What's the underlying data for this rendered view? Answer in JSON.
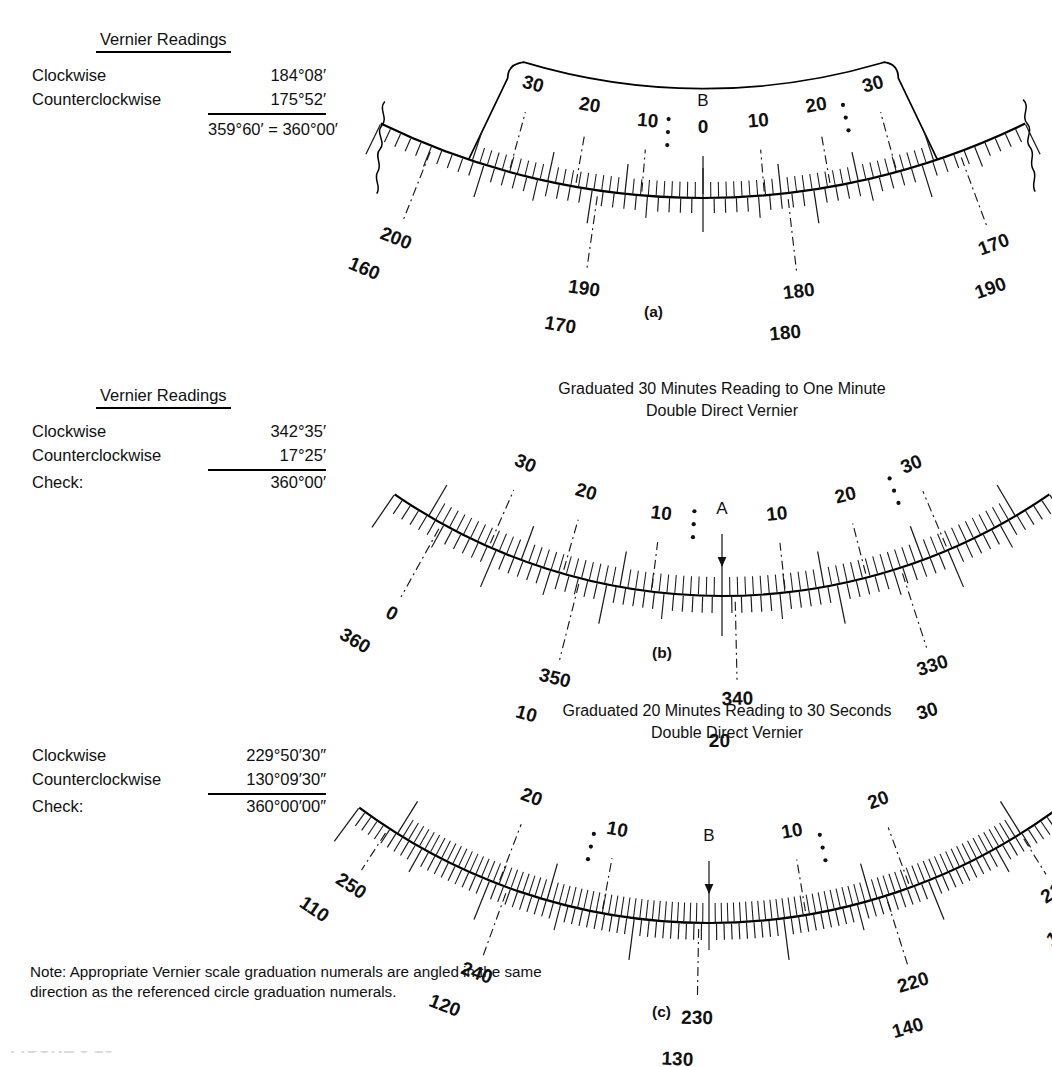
{
  "figure": {
    "kind": "double-direct-vernier-scales",
    "note": "Note: Appropriate Vernier scale graduation numerals are angled in the same direction as the referenced circle graduation numerals.",
    "caption_partial": "FIGURE 6-16"
  },
  "panel_a": {
    "sub_label": "(a)",
    "readings": {
      "title": "Vernier Readings",
      "rows": [
        {
          "label": "Clockwise",
          "value": "184°08′"
        },
        {
          "label": "Counterclockwise",
          "value": "175°52′"
        }
      ],
      "sum": "359°60′ = 360°00′"
    },
    "index_mark": "B",
    "vernier_labels": [
      "30",
      "20",
      "10",
      "0",
      "10",
      "20",
      "30"
    ],
    "circle_labels_outer": [
      "200",
      "190",
      "180",
      "170"
    ],
    "circle_labels_inner": [
      "160",
      "170",
      "180",
      "190"
    ]
  },
  "panel_b": {
    "sub_label": "(b)",
    "title_line1": "Graduated 30 Minutes Reading to One Minute",
    "title_line2": "Double Direct Vernier",
    "readings": {
      "title": "Vernier Readings",
      "rows": [
        {
          "label": "Clockwise",
          "value": "342°35′"
        },
        {
          "label": "Counterclockwise",
          "value": "17°25′"
        },
        {
          "label": "Check:",
          "value": "360°00′"
        }
      ]
    },
    "index_mark": "A",
    "vernier_labels": [
      "30",
      "20",
      "10",
      "10",
      "20",
      "30"
    ],
    "circle_labels_outer": [
      "0",
      "350",
      "340",
      "330"
    ],
    "circle_labels_inner": [
      "360",
      "10",
      "20",
      "30"
    ]
  },
  "panel_c": {
    "sub_label": "(c)",
    "title_line1": "Graduated 20 Minutes Reading to 30 Seconds",
    "title_line2": "Double Direct Vernier",
    "readings": {
      "title": "",
      "rows": [
        {
          "label": "Clockwise",
          "value": "229°50′30″"
        },
        {
          "label": "Counterclockwise",
          "value": "130°09′30″"
        },
        {
          "label": "Check:",
          "value": "360°00′00″"
        }
      ]
    },
    "index_mark": "B",
    "vernier_labels": [
      "20",
      "10",
      "10",
      "20"
    ],
    "circle_labels_outer": [
      "250",
      "240",
      "230",
      "220",
      "210"
    ],
    "circle_labels_inner": [
      "110",
      "120",
      "130",
      "140",
      "150"
    ]
  },
  "chart_data": {
    "type": "diagram",
    "panels": [
      {
        "id": "a",
        "graduation": "",
        "index": "B",
        "vernier_ticks": 61,
        "circle_ticks": 61,
        "vernier_numerals": [
          30,
          20,
          10,
          0,
          10,
          20,
          30
        ],
        "circle_numerals_cw": [
          200,
          190,
          180,
          170
        ],
        "circle_numerals_ccw": [
          160,
          170,
          180,
          190
        ],
        "reading_clockwise": "184°08′",
        "reading_counterclockwise": "175°52′",
        "check": "359°60′ = 360°00′"
      },
      {
        "id": "b",
        "graduation": "30 minutes, reading to one minute",
        "index": "A",
        "vernier_ticks": 61,
        "circle_ticks": 61,
        "vernier_numerals": [
          30,
          20,
          10,
          10,
          20,
          30
        ],
        "circle_numerals_cw": [
          0,
          350,
          340,
          330
        ],
        "circle_numerals_ccw": [
          360,
          10,
          20,
          30
        ],
        "reading_clockwise": "342°35′",
        "reading_counterclockwise": "17°25′",
        "check": "360°00′"
      },
      {
        "id": "c",
        "graduation": "20 minutes, reading to 30 seconds",
        "index": "B",
        "vernier_ticks": 81,
        "circle_ticks": 81,
        "vernier_numerals": [
          20,
          10,
          10,
          20
        ],
        "circle_numerals_cw": [
          250,
          240,
          230,
          220,
          210
        ],
        "circle_numerals_ccw": [
          110,
          120,
          130,
          140,
          150
        ],
        "reading_clockwise": "229°50′30″",
        "reading_counterclockwise": "130°09′30″",
        "check": "360°00′00″"
      }
    ]
  }
}
